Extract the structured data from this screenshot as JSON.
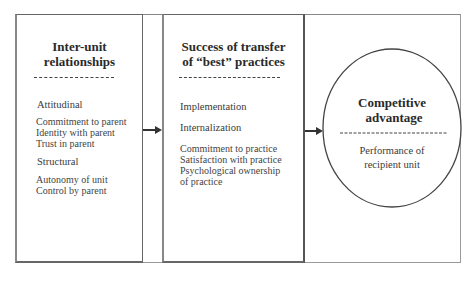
{
  "box1": {
    "title_line1": "Inter-unit",
    "title_line2": "relationships",
    "groups": [
      {
        "heading": "Attitudinal",
        "items": [
          "Commitment to parent",
          "Identity with parent",
          "Trust in parent"
        ]
      },
      {
        "heading": "Structural",
        "items": [
          "Autonomy of unit",
          "Control by parent"
        ]
      }
    ]
  },
  "box2": {
    "title_line1": "Success of transfer",
    "title_line2": "of “best” practices",
    "headings": [
      "Implementation",
      "Internalization"
    ],
    "items": [
      "Commitment to practice",
      "Satisfaction with practice",
      "Psychological ownership",
      "of practice"
    ]
  },
  "circle": {
    "title_line1": "Competitive",
    "title_line2": "advantage",
    "items": [
      "Performance of",
      "recipient unit"
    ]
  },
  "colors": {
    "line": "#333333",
    "text": "#444444",
    "title": "#2a2a2a"
  }
}
